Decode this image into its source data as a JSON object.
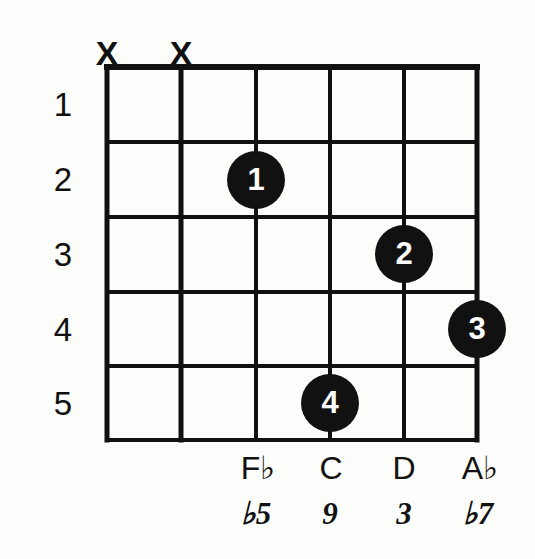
{
  "diagram": {
    "type": "guitar-chord-diagram",
    "frets": [
      {
        "label": "1"
      },
      {
        "label": "2"
      },
      {
        "label": "3"
      },
      {
        "label": "4"
      },
      {
        "label": "5"
      }
    ],
    "strings": [
      {
        "index": 1,
        "mute": "X",
        "note": "",
        "interval": ""
      },
      {
        "index": 2,
        "mute": "X",
        "note": "",
        "interval": ""
      },
      {
        "index": 3,
        "mute": "",
        "note": "F♭",
        "interval": "♭5"
      },
      {
        "index": 4,
        "mute": "",
        "note": "C",
        "interval": "9"
      },
      {
        "index": 5,
        "mute": "",
        "note": "D",
        "interval": "3"
      },
      {
        "index": 6,
        "mute": "",
        "note": "A♭",
        "interval": "♭7"
      }
    ],
    "fingers": [
      {
        "label": "1",
        "string": 3,
        "fret": 2
      },
      {
        "label": "2",
        "string": 5,
        "fret": 3
      },
      {
        "label": "3",
        "string": 6,
        "fret": 4
      },
      {
        "label": "4",
        "string": 4,
        "fret": 5
      }
    ],
    "colors": {
      "ink": "#111111",
      "paper": "#fdfdfc",
      "dot_fill": "#111111",
      "dot_text": "#ffffff"
    }
  }
}
